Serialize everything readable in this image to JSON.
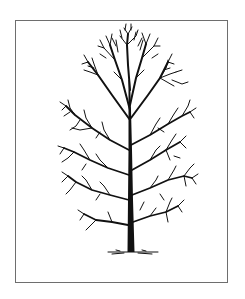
{
  "illustration": {
    "subject": "Bare deciduous tree line drawing",
    "description": "Black ink sketch of a leafless tree with a straight central trunk, upright dense crown, and spreading lateral branches, standing on a short ground line inside a thin gray rectangular frame",
    "colors": {
      "background": "#ffffff",
      "frame": "#6e6e6e",
      "ink": "#111111"
    }
  }
}
